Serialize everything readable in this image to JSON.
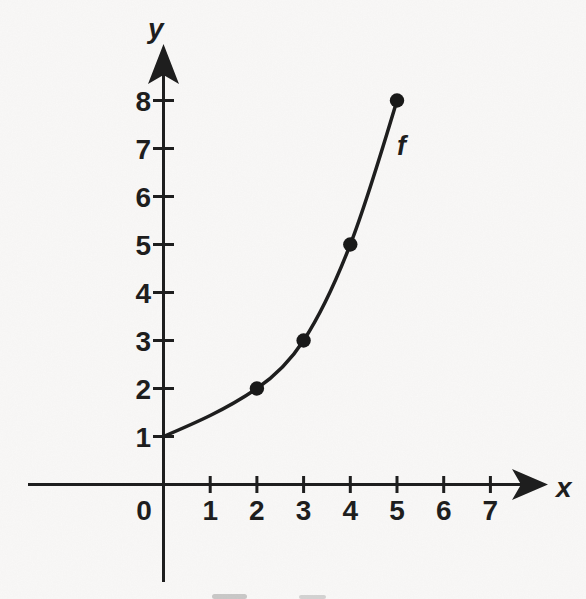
{
  "figure": {
    "background_color": "#fbfaf9",
    "ink_color": "#1e1e1e",
    "dot_color": "#191919"
  },
  "labels": {
    "x_axis": "x",
    "y_axis": "y",
    "curve": "f"
  },
  "chart_data": {
    "type": "line",
    "title": "",
    "xlabel": "x",
    "ylabel": "y",
    "curve_label": "f",
    "grid": false,
    "legend_position": "none",
    "xlim": [
      0,
      8
    ],
    "ylim": [
      0,
      9
    ],
    "x_tick_values": [
      0,
      1,
      2,
      3,
      4,
      5,
      6,
      7
    ],
    "x_tick_labels": [
      "0",
      "1",
      "2",
      "3",
      "4",
      "5",
      "6",
      "7"
    ],
    "y_tick_values": [
      1,
      2,
      3,
      4,
      5,
      6,
      7,
      8
    ],
    "y_tick_labels": [
      "1",
      "2",
      "3",
      "4",
      "5",
      "6",
      "7",
      "8"
    ],
    "curve_points": [
      [
        0,
        1
      ],
      [
        2,
        2
      ],
      [
        3,
        3
      ],
      [
        4,
        5
      ],
      [
        5,
        8
      ]
    ],
    "marked_points": [
      [
        2,
        2
      ],
      [
        3,
        3
      ],
      [
        4,
        5
      ],
      [
        5,
        8
      ]
    ]
  }
}
